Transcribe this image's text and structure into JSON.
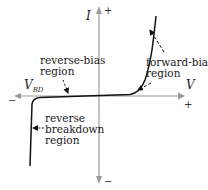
{
  "diagram": {
    "axes": {
      "y_label": "I",
      "x_label": "V",
      "y_positive_sign": "+",
      "y_negative_sign": "−",
      "x_positive_sign": "+",
      "x_negative_sign": "−",
      "breakdown_voltage_label": "V",
      "breakdown_voltage_subscript": "BD",
      "axis_color": "#9a9a9a",
      "curve_color": "#111111"
    },
    "regions": {
      "reverse_bias": {
        "line1": "reverse-bias",
        "line2": "region"
      },
      "forward_bias": {
        "line1": "forward-bias",
        "line2": "region"
      },
      "reverse_breakdown": {
        "line1": "reverse",
        "line2": "breakdown",
        "line3": "region"
      }
    }
  }
}
